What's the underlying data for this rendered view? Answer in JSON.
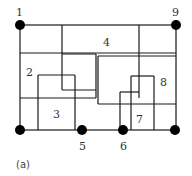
{
  "figure": {
    "caption": "(a)",
    "line_color": "#1a1a1a",
    "node_color": "#000000",
    "nodes": [
      {
        "id": "1",
        "label": "1",
        "x": 20,
        "y": 25,
        "label_x": 17,
        "label_y": 15
      },
      {
        "id": "9",
        "label": "9",
        "x": 176,
        "y": 25,
        "label_x": 172,
        "label_y": 15
      },
      {
        "id": "bl",
        "label": "",
        "x": 20,
        "y": 130,
        "label_x": 0,
        "label_y": 0
      },
      {
        "id": "5",
        "label": "5",
        "x": 82,
        "y": 130,
        "label_x": 79,
        "label_y": 149
      },
      {
        "id": "6",
        "label": "6",
        "x": 123,
        "y": 130,
        "label_x": 120,
        "label_y": 149
      },
      {
        "id": "br",
        "label": "",
        "x": 175,
        "y": 130,
        "label_x": 0,
        "label_y": 0
      }
    ],
    "regions": [
      {
        "id": "2",
        "label": "2",
        "x": 26,
        "y": 75
      },
      {
        "id": "3",
        "label": "3",
        "x": 54,
        "y": 118
      },
      {
        "id": "4",
        "label": "4",
        "x": 103,
        "y": 46
      },
      {
        "id": "7",
        "label": "7",
        "x": 137,
        "y": 123
      },
      {
        "id": "8",
        "label": "8",
        "x": 161,
        "y": 85
      }
    ]
  }
}
